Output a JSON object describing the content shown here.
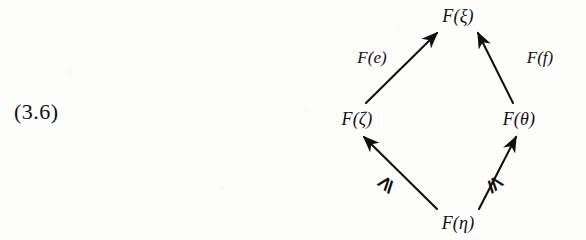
{
  "equation": {
    "number": "(3.6)"
  },
  "diagram": {
    "type": "commutative-diamond",
    "nodes": [
      {
        "id": "top",
        "label": "F(ξ)",
        "x": 458,
        "y": 16
      },
      {
        "id": "left",
        "label": "F(ζ)",
        "x": 357,
        "y": 119
      },
      {
        "id": "right",
        "label": "F(θ)",
        "x": 519,
        "y": 119
      },
      {
        "id": "bottom",
        "label": "F(η)",
        "x": 458,
        "y": 223
      }
    ],
    "edges": [
      {
        "id": "left-to-top",
        "from": "left",
        "to": "top",
        "label": "F(e)",
        "label_x": 372,
        "label_y": 58,
        "arrow": "up-right",
        "x1": 366,
        "y1": 103,
        "x2": 437,
        "y2": 33
      },
      {
        "id": "right-to-top",
        "from": "right",
        "to": "top",
        "label": "F(f)",
        "label_x": 540,
        "label_y": 58,
        "arrow": "up-left",
        "x1": 513,
        "y1": 103,
        "x2": 478,
        "y2": 33
      },
      {
        "id": "bottom-to-left",
        "from": "bottom",
        "to": "left",
        "label": "⩾",
        "label_x": 385,
        "label_y": 183,
        "arrow": "up-left",
        "x1": 437,
        "y1": 209,
        "x2": 364,
        "y2": 137
      },
      {
        "id": "bottom-to-right",
        "from": "bottom",
        "to": "right",
        "label": "⩽",
        "label_x": 496,
        "label_y": 183,
        "arrow": "up-right",
        "x1": 479,
        "y1": 209,
        "x2": 516,
        "y2": 137
      }
    ],
    "colors": {
      "ink": "#101010",
      "background": "#fdfdfc"
    }
  }
}
